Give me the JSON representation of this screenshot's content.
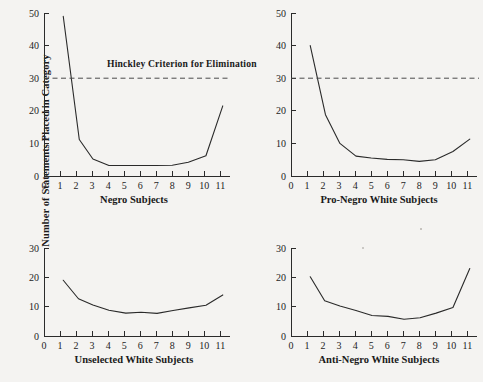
{
  "figure": {
    "ylabel": "Number of Statements Placed in Category",
    "annotation_label": "Hinckley Criterion for Elimination",
    "annotation_value": 30,
    "background_color": "#f4f3f1",
    "line_color": "#2a2a2a",
    "axis_color": "#2b2b2b",
    "criterion_color": "#4a4a4a"
  },
  "chart_data": [
    {
      "type": "line",
      "title": "Negro Subjects",
      "panel": "top-left",
      "xlabel": "Negro Subjects",
      "ylabel": "Number of Statements Placed in Category",
      "x": [
        1.2,
        2.2,
        3.05,
        4.05,
        5,
        6,
        7,
        8,
        9,
        10.1,
        11.15
      ],
      "values": [
        49,
        11.2,
        5.2,
        3.2,
        3.2,
        3.2,
        3.2,
        3.3,
        4.2,
        6.2,
        21.5
      ],
      "xticks": [
        0,
        1,
        2,
        3,
        4,
        5,
        6,
        7,
        8,
        9,
        10,
        11
      ],
      "yticks": [
        0,
        10,
        20,
        30,
        40,
        50
      ],
      "xlim": [
        0,
        11.6
      ],
      "ylim": [
        0,
        50
      ],
      "grid": false,
      "annotation": {
        "label": "Hinckley Criterion for Elimination",
        "y": 30,
        "style": "dashed"
      }
    },
    {
      "type": "line",
      "title": "Pro-Negro White Subjects",
      "panel": "top-right",
      "xlabel": "Pro-Negro White Subjects",
      "ylabel": "Number of Statements Placed in Category",
      "x": [
        1.2,
        2.15,
        3.05,
        4.05,
        5,
        6,
        7,
        8,
        9,
        10.1,
        11.15
      ],
      "values": [
        40,
        18.8,
        10.0,
        6.1,
        5.5,
        5.1,
        5.0,
        4.5,
        5.0,
        7.5,
        11.3
      ],
      "xticks": [
        0,
        1,
        2,
        3,
        4,
        5,
        6,
        7,
        8,
        9,
        10,
        11
      ],
      "yticks": [
        0,
        10,
        20,
        30,
        40,
        50
      ],
      "xlim": [
        0,
        11.6
      ],
      "ylim": [
        0,
        50
      ],
      "grid": false,
      "annotation": {
        "label": "Hinckley Criterion for Elimination",
        "y": 30,
        "style": "dashed"
      }
    },
    {
      "type": "line",
      "title": "Unselected White Subjects",
      "panel": "bottom-left",
      "xlabel": "Unselected White Subjects",
      "ylabel": "Number of Statements Placed in Category",
      "x": [
        1.2,
        2.15,
        3.05,
        4.05,
        5.1,
        6.05,
        7.05,
        8.05,
        9.05,
        10.1,
        11.15
      ],
      "values": [
        19.0,
        12.7,
        10.6,
        8.8,
        7.8,
        8.1,
        7.7,
        8.7,
        9.6,
        10.5,
        14.0
      ],
      "xticks": [
        0,
        1,
        2,
        3,
        4,
        5,
        6,
        7,
        8,
        9,
        10,
        11
      ],
      "yticks": [
        0,
        10,
        20,
        30
      ],
      "xlim": [
        0,
        11.6
      ],
      "ylim": [
        0,
        30
      ],
      "grid": false
    },
    {
      "type": "line",
      "title": "Anti-Negro White Subjects",
      "panel": "bottom-right",
      "xlabel": "Anti-Negro White Subjects",
      "ylabel": "Number of Statements Placed in Category",
      "x": [
        1.2,
        2.1,
        3.05,
        4.05,
        5.05,
        6.05,
        7.05,
        8.05,
        9.05,
        10.1,
        11.15
      ],
      "values": [
        20.2,
        12.0,
        10.2,
        8.7,
        7.0,
        6.7,
        5.7,
        6.2,
        7.8,
        9.7,
        23.0
      ],
      "xticks": [
        0,
        1,
        2,
        3,
        4,
        5,
        6,
        7,
        8,
        9,
        10,
        11
      ],
      "yticks": [
        0,
        10,
        20,
        30
      ],
      "xlim": [
        0,
        11.6
      ],
      "ylim": [
        0,
        30
      ],
      "grid": false
    }
  ]
}
